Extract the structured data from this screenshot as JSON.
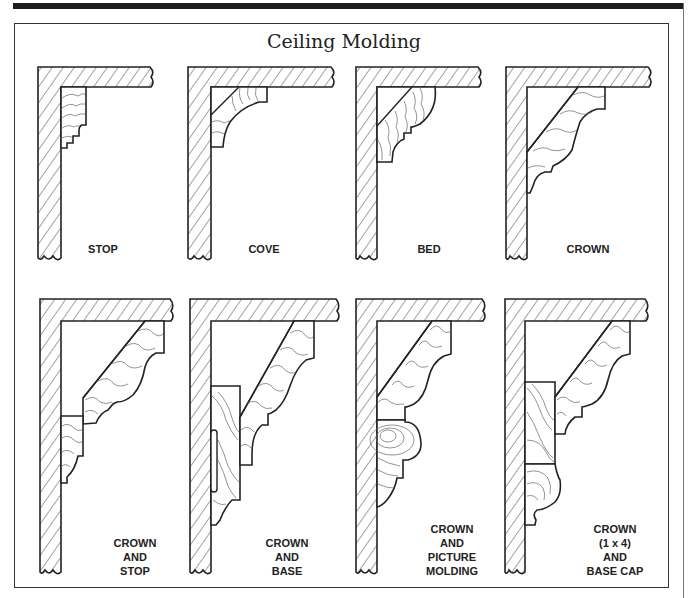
{
  "figure": {
    "title": "Ceiling Molding",
    "colors": {
      "ink": "#222222",
      "paper": "#ffffff",
      "grain": "#555555",
      "top_bar": "#1e1e1e"
    }
  },
  "panels": [
    {
      "id": "stop",
      "label": "STOP",
      "row": 1,
      "col": 1
    },
    {
      "id": "cove",
      "label": "COVE",
      "row": 1,
      "col": 2
    },
    {
      "id": "bed",
      "label": "BED",
      "row": 1,
      "col": 3
    },
    {
      "id": "crown",
      "label": "CROWN",
      "row": 1,
      "col": 4
    },
    {
      "id": "crown-and-stop",
      "label_lines": [
        "CROWN",
        "AND",
        "STOP"
      ],
      "row": 2,
      "col": 1
    },
    {
      "id": "crown-and-base",
      "label_lines": [
        "CROWN",
        "AND",
        "BASE"
      ],
      "row": 2,
      "col": 2
    },
    {
      "id": "crown-and-picture-molding",
      "label_lines": [
        "CROWN",
        "AND",
        "PICTURE",
        "MOLDING"
      ],
      "row": 2,
      "col": 3
    },
    {
      "id": "crown-1x4-and-base-cap",
      "label_lines": [
        "CROWN",
        "(1 x 4)",
        "AND",
        "BASE CAP"
      ],
      "row": 2,
      "col": 4
    }
  ]
}
